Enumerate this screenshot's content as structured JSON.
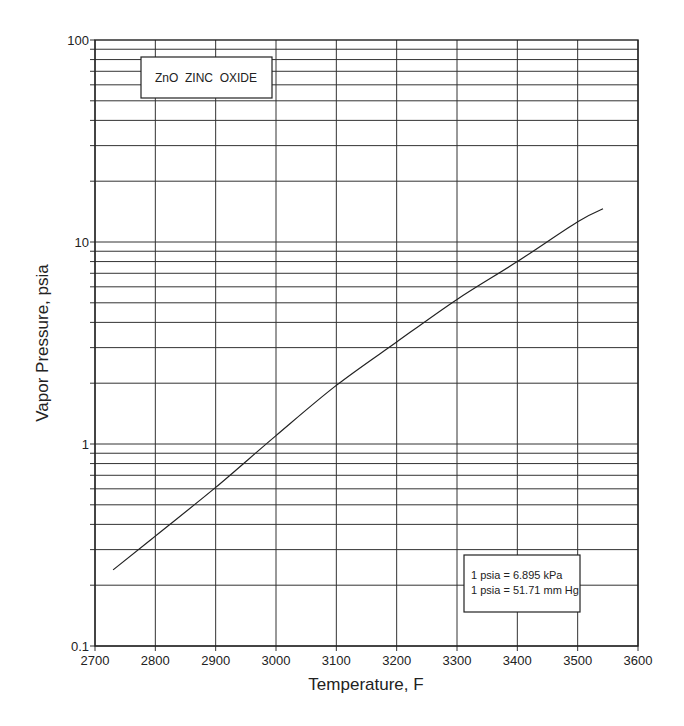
{
  "chart_data": {
    "type": "line",
    "title": "ZnO  ZINC  OXIDE",
    "xlabel": "Temperature, F",
    "ylabel": "Vapor Pressure, psia",
    "xlim": [
      2700,
      3600
    ],
    "ylim": [
      0.1,
      100
    ],
    "yscale": "log",
    "grid": true,
    "x_ticks": [
      2700,
      2800,
      2900,
      3000,
      3100,
      3200,
      3300,
      3400,
      3500,
      3600
    ],
    "x_tick_labels": [
      "2700",
      "2800",
      "2900",
      "3000",
      "3100",
      "3200",
      "3300",
      "3400",
      "3500",
      "3600"
    ],
    "y_ticks": [
      0.1,
      1,
      10,
      100
    ],
    "y_tick_labels": [
      "0.1",
      "1",
      "10",
      "100"
    ],
    "series": [
      {
        "name": "ZnO vapor pressure",
        "x": [
          2730,
          2800,
          2900,
          3000,
          3100,
          3200,
          3300,
          3400,
          3500,
          3542
        ],
        "y": [
          0.238,
          0.35,
          0.61,
          1.1,
          1.95,
          3.2,
          5.2,
          8.0,
          12.6,
          14.6
        ]
      }
    ],
    "annotations": [
      "1 psia = 6.895 kPa",
      "1 psia = 51.71 mm Hg"
    ]
  },
  "title_box": {
    "label": "ZnO  ZINC  OXIDE"
  },
  "note_box": {
    "line1": "1 psia = 6.895 kPa",
    "line2": "1 psia = 51.71 mm Hg"
  },
  "axes": {
    "x_title": "Temperature, F",
    "y_title": "Vapor Pressure, psia"
  }
}
